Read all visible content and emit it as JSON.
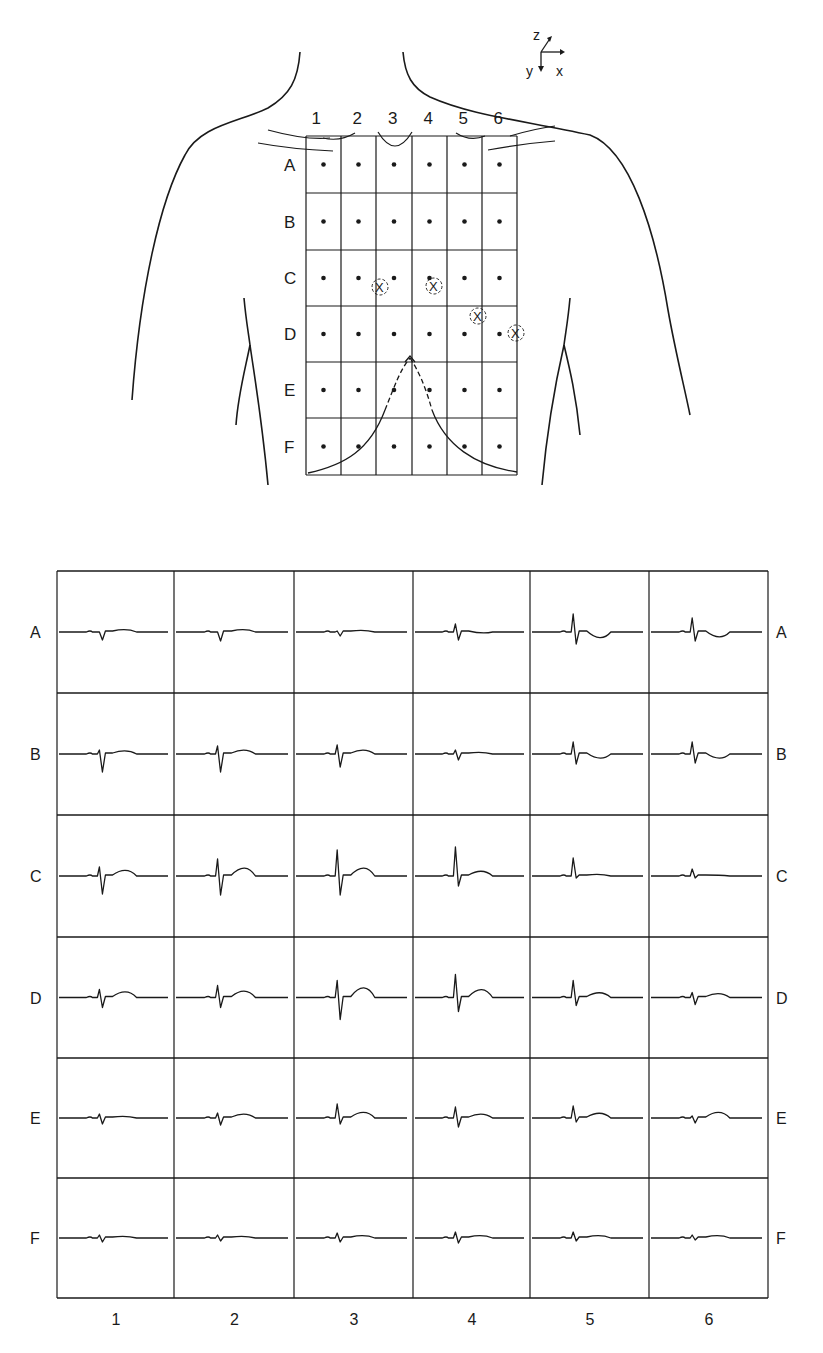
{
  "figure": {
    "type": "body-surface electrocardiographic map",
    "ink_color": "#1a1a1a",
    "background": "#ffffff"
  },
  "torso_diagram": {
    "axes": {
      "z": "z",
      "y": "y",
      "x": "x"
    },
    "column_labels": [
      "1",
      "2",
      "3",
      "4",
      "5",
      "6"
    ],
    "row_labels": [
      "A",
      "B",
      "C",
      "D",
      "E",
      "F"
    ],
    "electrodes": "dot at center of each of 36 grid cells",
    "marked_positions": [
      {
        "label": "X",
        "row": "C",
        "between_cols": "2-3"
      },
      {
        "label": "X",
        "row": "C",
        "col": "4"
      },
      {
        "label": "X",
        "row": "C/D boundary",
        "col": "5"
      },
      {
        "label": "X",
        "row": "D",
        "col": "6 (right edge)"
      }
    ]
  },
  "waveform_grid": {
    "row_labels_left": [
      "A",
      "B",
      "C",
      "D",
      "E",
      "F"
    ],
    "row_labels_right": [
      "A",
      "B",
      "C",
      "D",
      "E",
      "F"
    ],
    "column_labels_bottom": [
      "1",
      "2",
      "3",
      "4",
      "5",
      "6"
    ]
  },
  "chart_data": {
    "type": "table",
    "title": "",
    "rows": [
      "A",
      "B",
      "C",
      "D",
      "E",
      "F"
    ],
    "columns": [
      "1",
      "2",
      "3",
      "4",
      "5",
      "6"
    ],
    "cells": [
      [
        {
          "R": 0,
          "S": 8,
          "T": 2
        },
        {
          "R": 0,
          "S": 9,
          "T": 2
        },
        {
          "R": 1,
          "S": 4,
          "T": 1
        },
        {
          "R": 8,
          "S": 8,
          "T": -2
        },
        {
          "R": 18,
          "S": 12,
          "T": -8
        },
        {
          "R": 14,
          "S": 9,
          "T": -7
        }
      ],
      [
        {
          "R": 4,
          "S": 18,
          "T": 3
        },
        {
          "R": 8,
          "S": 18,
          "T": 4
        },
        {
          "R": 9,
          "S": 13,
          "T": 4
        },
        {
          "R": 4,
          "S": 6,
          "T": 1
        },
        {
          "R": 12,
          "S": 10,
          "T": -6
        },
        {
          "R": 12,
          "S": 9,
          "T": -6
        }
      ],
      [
        {
          "R": 9,
          "S": 18,
          "T": 6
        },
        {
          "R": 17,
          "S": 19,
          "T": 9
        },
        {
          "R": 26,
          "S": 19,
          "T": 9
        },
        {
          "R": 29,
          "S": 10,
          "T": 5
        },
        {
          "R": 18,
          "S": 2,
          "T": 1
        },
        {
          "R": 7,
          "S": 2,
          "T": 0
        }
      ],
      [
        {
          "R": 8,
          "S": 10,
          "T": 6
        },
        {
          "R": 12,
          "S": 10,
          "T": 7
        },
        {
          "R": 17,
          "S": 22,
          "T": 11
        },
        {
          "R": 23,
          "S": 14,
          "T": 9
        },
        {
          "R": 17,
          "S": 8,
          "T": 5
        },
        {
          "R": 5,
          "S": 7,
          "T": 4
        }
      ],
      [
        {
          "R": 4,
          "S": 6,
          "T": 1
        },
        {
          "R": 5,
          "S": 7,
          "T": 4
        },
        {
          "R": 14,
          "S": 6,
          "T": 6
        },
        {
          "R": 11,
          "S": 9,
          "T": 4
        },
        {
          "R": 12,
          "S": 4,
          "T": 5
        },
        {
          "R": 2,
          "S": 5,
          "T": 6
        }
      ],
      [
        {
          "R": 3,
          "S": 4,
          "T": 1
        },
        {
          "R": 3,
          "S": 3,
          "T": 1
        },
        {
          "R": 5,
          "S": 4,
          "T": 2
        },
        {
          "R": 6,
          "S": 5,
          "T": 2
        },
        {
          "R": 6,
          "S": 3,
          "T": 2
        },
        {
          "R": 3,
          "S": 2,
          "T": 2
        }
      ]
    ],
    "xlabel": "electrode column (1-6)",
    "ylabel": "electrode row (A-F)",
    "grid": true,
    "legend": null
  }
}
